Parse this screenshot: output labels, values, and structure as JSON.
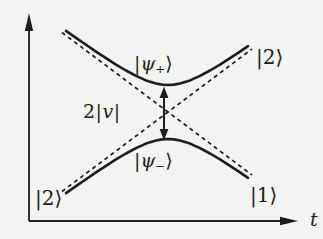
{
  "figure": {
    "colors": {
      "ink": "#1d1d1b",
      "paper": "#f3f3f1"
    },
    "labels": {
      "psi_plus": {
        "open": "|",
        "sym": "ψ",
        "sub": "+",
        "close": "⟩"
      },
      "psi_minus": {
        "open": "|",
        "sym": "ψ",
        "sub": "−",
        "close": "⟩"
      },
      "gap": {
        "coef": "2",
        "open": "|",
        "sym": "v",
        "close": "|"
      },
      "ket_top_right": {
        "open": "|",
        "sym": "2",
        "close": "⟩"
      },
      "ket_bottom_right": {
        "open": "|",
        "sym": "1",
        "close": "⟩"
      },
      "ket_bottom_left": {
        "open": "|",
        "sym": "2",
        "close": "⟩"
      },
      "axis_t": "t"
    }
  }
}
